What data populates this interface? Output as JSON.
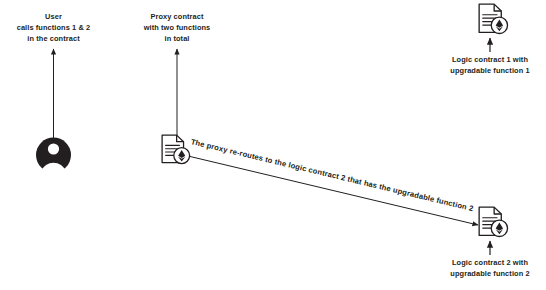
{
  "diagram": {
    "background_color": "#ffffff",
    "stroke_color": "#231f20",
    "text_color": "#231f20",
    "nodes": {
      "user": {
        "icon": "user-avatar-icon",
        "label_lines": [
          "User",
          "calls functions 1 & 2",
          "in the contract"
        ]
      },
      "proxy_contract": {
        "icon": "contract-document-ethereum-icon",
        "label_lines": [
          "Proxy contract",
          "with two functions",
          "in total"
        ]
      },
      "logic_contract_1": {
        "icon": "contract-document-ethereum-icon",
        "label_lines": [
          "Logic contract 1 with",
          "upgradable function 1"
        ]
      },
      "logic_contract_2": {
        "icon": "contract-document-ethereum-icon",
        "label_lines": [
          "Logic contract 2 with",
          "upgradable function 2"
        ]
      }
    },
    "edges": {
      "proxy_to_logic2": {
        "label": "The proxy re-routes to the logic contract 2 that has the upgradable function 2",
        "from": "proxy_contract",
        "to": "logic_contract_2",
        "arrow": "end"
      },
      "user_callout": {
        "arrow": "end",
        "direction": "up"
      },
      "proxy_callout": {
        "arrow": "end",
        "direction": "up"
      },
      "logic1_callout": {
        "arrow": "end",
        "direction": "up"
      },
      "logic2_callout": {
        "arrow": "end",
        "direction": "up"
      }
    }
  }
}
